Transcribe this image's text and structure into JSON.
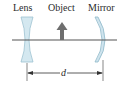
{
  "diagram": {
    "labels": {
      "lens": "Lens",
      "object": "Object",
      "mirror": "Mirror",
      "distance": "d"
    },
    "elements": {
      "lens": {
        "type": "diverging-lens",
        "color": "#cfe6ef",
        "edge_color": "#8fb9c9"
      },
      "object": {
        "type": "upward-arrow",
        "color": "#6e6e6e"
      },
      "mirror": {
        "type": "concave-mirror",
        "color": "#cfe6ef",
        "edge_color": "#8fb9c9"
      },
      "optical_axis": {
        "color": "#555555"
      },
      "dimension": {
        "from": "lens",
        "to": "mirror",
        "label": "d",
        "color": "#333333"
      }
    }
  }
}
